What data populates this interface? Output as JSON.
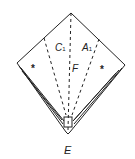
{
  "diagram": {
    "type": "origami-fold",
    "labels": {
      "c": "C",
      "c_sub": "1",
      "a": "A",
      "a_sub": "1",
      "f": "F",
      "e": "E"
    },
    "markers": [
      "*",
      "*"
    ],
    "line_color": "#222222"
  }
}
